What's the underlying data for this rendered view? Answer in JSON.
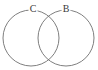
{
  "figure": {
    "type": "venn-diagram",
    "background_color": "#ffffff",
    "stroke_color": "#6f6f6f",
    "label_color": "#3a3a3a",
    "width": 98,
    "height": 70,
    "sets": [
      {
        "id": "set-c",
        "label": "C",
        "label_x": 33,
        "label_y": 9,
        "center_x": 31,
        "center_y": 38,
        "radius": 28
      },
      {
        "id": "set-b",
        "label": "B",
        "label_x": 66,
        "label_y": 9,
        "center_x": 66,
        "center_y": 38,
        "radius": 28
      }
    ],
    "intersections": [
      {
        "x": 49,
        "y": 14
      },
      {
        "x": 49,
        "y": 58
      }
    ]
  }
}
